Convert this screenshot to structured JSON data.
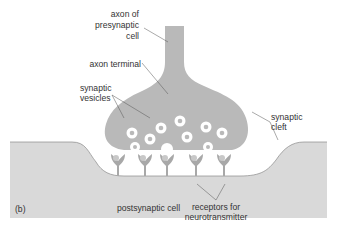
{
  "figure": {
    "panel_label": "(b)",
    "colors": {
      "background": "#ffffff",
      "cell_fill": "#b9b9b9",
      "postsynaptic_fill": "#d9d9d9",
      "outline": "#8a8a8a",
      "vesicle": "#ffffff",
      "vesicle_core": "#b9b9b9",
      "receptor": "#a8a8a8",
      "text": "#333333"
    },
    "labels": {
      "axon_presynaptic_line1": "axon of",
      "axon_presynaptic_line2": "presynaptic",
      "axon_presynaptic_line3": "cell",
      "axon_terminal": "axon terminal",
      "synaptic_vesicles_line1": "synaptic",
      "synaptic_vesicles_line2": "vesicles",
      "synaptic_cleft_line1": "synaptic",
      "synaptic_cleft_line2": "cleft",
      "postsynaptic_cell": "postsynaptic cell",
      "receptors_line1": "receptors for",
      "receptors_line2": "neurotransmitter"
    },
    "counts": {
      "vesicles_inside": 8,
      "vesicles_releasing": 3,
      "receptors": 5
    }
  }
}
